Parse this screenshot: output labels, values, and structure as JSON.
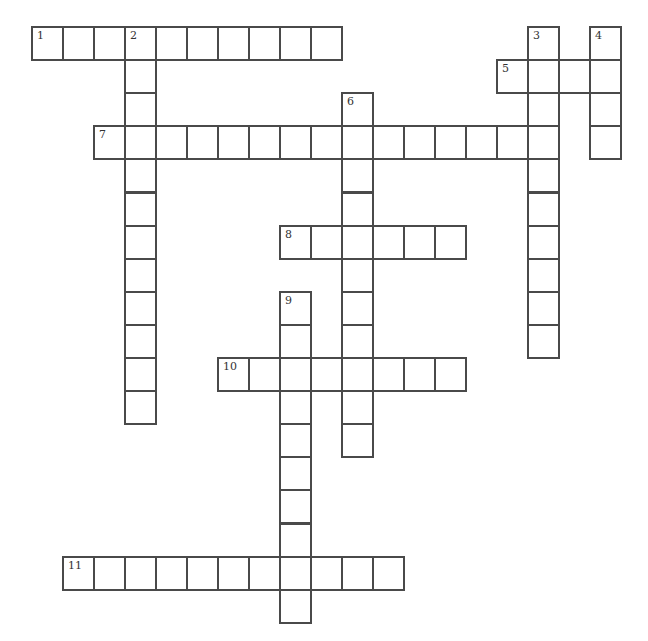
{
  "puzzle": {
    "rows": 18,
    "cols": 19,
    "line_color": "#4a4a4a",
    "background_color": "#ffffff",
    "entries": [
      {
        "number": "1",
        "direction": "across",
        "row": 0,
        "col": 0,
        "length": 10
      },
      {
        "number": "2",
        "direction": "down",
        "row": 0,
        "col": 3,
        "length": 12
      },
      {
        "number": "3",
        "direction": "down",
        "row": 0,
        "col": 16,
        "length": 10
      },
      {
        "number": "4",
        "direction": "down",
        "row": 0,
        "col": 18,
        "length": 4
      },
      {
        "number": "5",
        "direction": "across",
        "row": 1,
        "col": 15,
        "length": 4
      },
      {
        "number": "6",
        "direction": "down",
        "row": 2,
        "col": 10,
        "length": 11
      },
      {
        "number": "7",
        "direction": "across",
        "row": 3,
        "col": 2,
        "length": 15
      },
      {
        "number": "8",
        "direction": "across",
        "row": 6,
        "col": 8,
        "length": 6
      },
      {
        "number": "9",
        "direction": "down",
        "row": 8,
        "col": 8,
        "length": 10
      },
      {
        "number": "10",
        "direction": "across",
        "row": 10,
        "col": 6,
        "length": 8
      },
      {
        "number": "11",
        "direction": "across",
        "row": 16,
        "col": 1,
        "length": 11
      }
    ]
  }
}
